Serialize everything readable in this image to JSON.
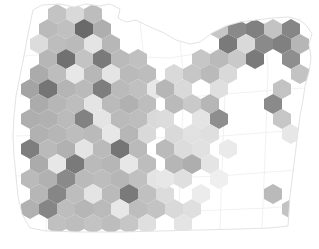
{
  "figure": {
    "title": "",
    "subtitle": "",
    "background_color": "#ffffff",
    "state_outline_color": "#e3e3e3",
    "county_line_color": "#ededed"
  },
  "chart_data": {
    "type": "heatmap",
    "subtype": "hexbin-density-map",
    "title": "",
    "xlabel": "",
    "ylabel": "",
    "grid": false,
    "legend": null,
    "region": "Oregon",
    "projection_bounds": {
      "x": [
        0,
        319
      ],
      "y": [
        0,
        249
      ]
    },
    "hex_geometry": {
      "orientation": "pointy-top",
      "width": 18,
      "height": 20,
      "col_spacing": 18,
      "row_spacing": 15,
      "row_offset": 9
    },
    "value_range": [
      0,
      1
    ],
    "colormap": "greys",
    "colormap_stops": [
      {
        "v": 0.0,
        "hex": "#ffffff"
      },
      {
        "v": 0.12,
        "hex": "#f2f2f2"
      },
      {
        "v": 0.25,
        "hex": "#e0e0e0"
      },
      {
        "v": 0.38,
        "hex": "#cfcfcf"
      },
      {
        "v": 0.5,
        "hex": "#bdbdbd"
      },
      {
        "v": 0.62,
        "hex": "#ababab"
      },
      {
        "v": 0.75,
        "hex": "#949494"
      },
      {
        "v": 0.88,
        "hex": "#7a7a7a"
      },
      {
        "v": 1.0,
        "hex": "#5e5e5e"
      }
    ],
    "bins": [
      {
        "cx": 57,
        "cy": 14,
        "v": 0.46
      },
      {
        "cx": 75,
        "cy": 14,
        "v": 0.3
      },
      {
        "cx": 93,
        "cy": 14,
        "v": 0.5
      },
      {
        "cx": 48,
        "cy": 29,
        "v": 0.52
      },
      {
        "cx": 66,
        "cy": 29,
        "v": 0.48
      },
      {
        "cx": 84,
        "cy": 29,
        "v": 0.95
      },
      {
        "cx": 102,
        "cy": 29,
        "v": 0.6
      },
      {
        "cx": 39,
        "cy": 44,
        "v": 0.28
      },
      {
        "cx": 57,
        "cy": 44,
        "v": 0.5
      },
      {
        "cx": 75,
        "cy": 44,
        "v": 0.52
      },
      {
        "cx": 93,
        "cy": 44,
        "v": 0.22
      },
      {
        "cx": 111,
        "cy": 44,
        "v": 0.54
      },
      {
        "cx": 48,
        "cy": 59,
        "v": 0.55
      },
      {
        "cx": 66,
        "cy": 59,
        "v": 0.92
      },
      {
        "cx": 84,
        "cy": 59,
        "v": 0.46
      },
      {
        "cx": 102,
        "cy": 59,
        "v": 0.88
      },
      {
        "cx": 120,
        "cy": 59,
        "v": 0.52
      },
      {
        "cx": 138,
        "cy": 59,
        "v": 0.48
      },
      {
        "cx": 39,
        "cy": 74,
        "v": 0.62
      },
      {
        "cx": 57,
        "cy": 74,
        "v": 0.5
      },
      {
        "cx": 75,
        "cy": 74,
        "v": 0.2
      },
      {
        "cx": 93,
        "cy": 74,
        "v": 0.54
      },
      {
        "cx": 111,
        "cy": 74,
        "v": 0.22
      },
      {
        "cx": 129,
        "cy": 74,
        "v": 0.52
      },
      {
        "cx": 147,
        "cy": 74,
        "v": 0.5
      },
      {
        "cx": 30,
        "cy": 89,
        "v": 0.66
      },
      {
        "cx": 48,
        "cy": 89,
        "v": 0.9
      },
      {
        "cx": 66,
        "cy": 89,
        "v": 0.56
      },
      {
        "cx": 84,
        "cy": 89,
        "v": 0.52
      },
      {
        "cx": 102,
        "cy": 89,
        "v": 0.86
      },
      {
        "cx": 120,
        "cy": 89,
        "v": 0.52
      },
      {
        "cx": 138,
        "cy": 89,
        "v": 0.48
      },
      {
        "cx": 156,
        "cy": 89,
        "v": 0.2
      },
      {
        "cx": 39,
        "cy": 104,
        "v": 0.62
      },
      {
        "cx": 57,
        "cy": 104,
        "v": 0.55
      },
      {
        "cx": 75,
        "cy": 104,
        "v": 0.5
      },
      {
        "cx": 93,
        "cy": 104,
        "v": 0.22
      },
      {
        "cx": 111,
        "cy": 104,
        "v": 0.52
      },
      {
        "cx": 129,
        "cy": 104,
        "v": 0.58
      },
      {
        "cx": 147,
        "cy": 104,
        "v": 0.5
      },
      {
        "cx": 30,
        "cy": 119,
        "v": 0.6
      },
      {
        "cx": 48,
        "cy": 119,
        "v": 0.58
      },
      {
        "cx": 66,
        "cy": 119,
        "v": 0.52
      },
      {
        "cx": 84,
        "cy": 119,
        "v": 0.84
      },
      {
        "cx": 102,
        "cy": 119,
        "v": 0.22
      },
      {
        "cx": 120,
        "cy": 119,
        "v": 0.52
      },
      {
        "cx": 138,
        "cy": 119,
        "v": 0.5
      },
      {
        "cx": 156,
        "cy": 119,
        "v": 0.3
      },
      {
        "cx": 39,
        "cy": 134,
        "v": 0.58
      },
      {
        "cx": 57,
        "cy": 134,
        "v": 0.55
      },
      {
        "cx": 75,
        "cy": 134,
        "v": 0.5
      },
      {
        "cx": 93,
        "cy": 134,
        "v": 0.52
      },
      {
        "cx": 111,
        "cy": 134,
        "v": 0.2
      },
      {
        "cx": 129,
        "cy": 134,
        "v": 0.55
      },
      {
        "cx": 147,
        "cy": 134,
        "v": 0.3
      },
      {
        "cx": 30,
        "cy": 149,
        "v": 0.86
      },
      {
        "cx": 48,
        "cy": 149,
        "v": 0.52
      },
      {
        "cx": 66,
        "cy": 149,
        "v": 0.58
      },
      {
        "cx": 84,
        "cy": 149,
        "v": 0.22
      },
      {
        "cx": 102,
        "cy": 149,
        "v": 0.52
      },
      {
        "cx": 120,
        "cy": 149,
        "v": 0.9
      },
      {
        "cx": 138,
        "cy": 149,
        "v": 0.52
      },
      {
        "cx": 39,
        "cy": 164,
        "v": 0.62
      },
      {
        "cx": 57,
        "cy": 164,
        "v": 0.2
      },
      {
        "cx": 75,
        "cy": 164,
        "v": 0.88
      },
      {
        "cx": 93,
        "cy": 164,
        "v": 0.52
      },
      {
        "cx": 111,
        "cy": 164,
        "v": 0.55
      },
      {
        "cx": 129,
        "cy": 164,
        "v": 0.2
      },
      {
        "cx": 147,
        "cy": 164,
        "v": 0.5
      },
      {
        "cx": 30,
        "cy": 179,
        "v": 0.52
      },
      {
        "cx": 48,
        "cy": 179,
        "v": 0.58
      },
      {
        "cx": 66,
        "cy": 179,
        "v": 0.8
      },
      {
        "cx": 84,
        "cy": 179,
        "v": 0.52
      },
      {
        "cx": 102,
        "cy": 179,
        "v": 0.5
      },
      {
        "cx": 120,
        "cy": 179,
        "v": 0.55
      },
      {
        "cx": 138,
        "cy": 179,
        "v": 0.48
      },
      {
        "cx": 156,
        "cy": 179,
        "v": 0.22
      },
      {
        "cx": 39,
        "cy": 194,
        "v": 0.55
      },
      {
        "cx": 57,
        "cy": 194,
        "v": 0.82
      },
      {
        "cx": 75,
        "cy": 194,
        "v": 0.5
      },
      {
        "cx": 93,
        "cy": 194,
        "v": 0.22
      },
      {
        "cx": 111,
        "cy": 194,
        "v": 0.52
      },
      {
        "cx": 129,
        "cy": 194,
        "v": 0.88
      },
      {
        "cx": 147,
        "cy": 194,
        "v": 0.48
      },
      {
        "cx": 165,
        "cy": 194,
        "v": 0.28
      },
      {
        "cx": 30,
        "cy": 209,
        "v": 0.58
      },
      {
        "cx": 48,
        "cy": 209,
        "v": 0.82
      },
      {
        "cx": 66,
        "cy": 209,
        "v": 0.5
      },
      {
        "cx": 84,
        "cy": 209,
        "v": 0.55
      },
      {
        "cx": 102,
        "cy": 209,
        "v": 0.52
      },
      {
        "cx": 120,
        "cy": 209,
        "v": 0.2
      },
      {
        "cx": 138,
        "cy": 209,
        "v": 0.5
      },
      {
        "cx": 156,
        "cy": 209,
        "v": 0.46
      },
      {
        "cx": 174,
        "cy": 209,
        "v": 0.3
      },
      {
        "cx": 192,
        "cy": 209,
        "v": 0.26
      },
      {
        "cx": 57,
        "cy": 224,
        "v": 0.48
      },
      {
        "cx": 75,
        "cy": 224,
        "v": 0.5
      },
      {
        "cx": 93,
        "cy": 224,
        "v": 0.46
      },
      {
        "cx": 111,
        "cy": 224,
        "v": 0.5
      },
      {
        "cx": 129,
        "cy": 224,
        "v": 0.44
      },
      {
        "cx": 147,
        "cy": 224,
        "v": 0.26
      },
      {
        "cx": 183,
        "cy": 224,
        "v": 0.22
      },
      {
        "cx": 201,
        "cy": 29,
        "v": 0.3
      },
      {
        "cx": 219,
        "cy": 29,
        "v": 0.44
      },
      {
        "cx": 237,
        "cy": 29,
        "v": 0.8
      },
      {
        "cx": 255,
        "cy": 29,
        "v": 0.85
      },
      {
        "cx": 273,
        "cy": 29,
        "v": 0.46
      },
      {
        "cx": 291,
        "cy": 29,
        "v": 0.82
      },
      {
        "cx": 228,
        "cy": 44,
        "v": 0.88
      },
      {
        "cx": 246,
        "cy": 44,
        "v": 0.3
      },
      {
        "cx": 264,
        "cy": 44,
        "v": 0.8
      },
      {
        "cx": 282,
        "cy": 44,
        "v": 0.85
      },
      {
        "cx": 300,
        "cy": 44,
        "v": 0.55
      },
      {
        "cx": 201,
        "cy": 59,
        "v": 0.44
      },
      {
        "cx": 219,
        "cy": 59,
        "v": 0.52
      },
      {
        "cx": 237,
        "cy": 59,
        "v": 0.42
      },
      {
        "cx": 255,
        "cy": 59,
        "v": 0.88
      },
      {
        "cx": 291,
        "cy": 59,
        "v": 0.78
      },
      {
        "cx": 174,
        "cy": 74,
        "v": 0.3
      },
      {
        "cx": 192,
        "cy": 74,
        "v": 0.44
      },
      {
        "cx": 210,
        "cy": 74,
        "v": 0.52
      },
      {
        "cx": 228,
        "cy": 74,
        "v": 0.3
      },
      {
        "cx": 300,
        "cy": 74,
        "v": 0.46
      },
      {
        "cx": 165,
        "cy": 89,
        "v": 0.55
      },
      {
        "cx": 183,
        "cy": 89,
        "v": 0.3
      },
      {
        "cx": 219,
        "cy": 89,
        "v": 0.26
      },
      {
        "cx": 282,
        "cy": 89,
        "v": 0.46
      },
      {
        "cx": 174,
        "cy": 104,
        "v": 0.52
      },
      {
        "cx": 192,
        "cy": 104,
        "v": 0.42
      },
      {
        "cx": 210,
        "cy": 104,
        "v": 0.55
      },
      {
        "cx": 273,
        "cy": 104,
        "v": 0.8
      },
      {
        "cx": 165,
        "cy": 119,
        "v": 0.28
      },
      {
        "cx": 201,
        "cy": 119,
        "v": 0.22
      },
      {
        "cx": 219,
        "cy": 119,
        "v": 0.78
      },
      {
        "cx": 282,
        "cy": 119,
        "v": 0.44
      },
      {
        "cx": 174,
        "cy": 134,
        "v": 0.3
      },
      {
        "cx": 192,
        "cy": 134,
        "v": 0.24
      },
      {
        "cx": 210,
        "cy": 134,
        "v": 0.26
      },
      {
        "cx": 291,
        "cy": 134,
        "v": 0.2
      },
      {
        "cx": 165,
        "cy": 149,
        "v": 0.52
      },
      {
        "cx": 183,
        "cy": 149,
        "v": 0.28
      },
      {
        "cx": 201,
        "cy": 149,
        "v": 0.24
      },
      {
        "cx": 228,
        "cy": 149,
        "v": 0.18
      },
      {
        "cx": 174,
        "cy": 164,
        "v": 0.55
      },
      {
        "cx": 192,
        "cy": 164,
        "v": 0.6
      },
      {
        "cx": 210,
        "cy": 164,
        "v": 0.22
      },
      {
        "cx": 165,
        "cy": 179,
        "v": 0.2
      },
      {
        "cx": 183,
        "cy": 179,
        "v": 0.26
      },
      {
        "cx": 219,
        "cy": 179,
        "v": 0.14
      },
      {
        "cx": 201,
        "cy": 194,
        "v": 0.16
      },
      {
        "cx": 273,
        "cy": 194,
        "v": 0.52
      },
      {
        "cx": 291,
        "cy": 209,
        "v": 0.46
      }
    ]
  }
}
